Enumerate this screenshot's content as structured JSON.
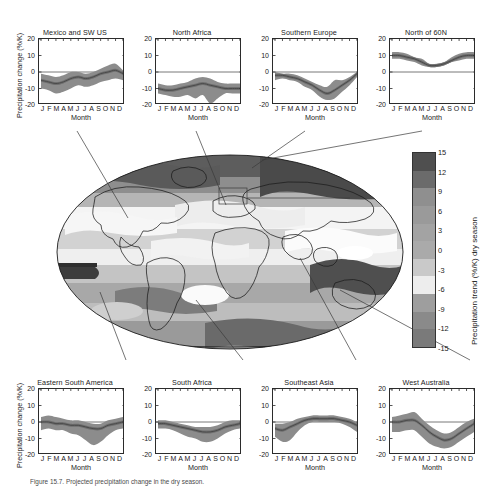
{
  "figure": {
    "caption": "Figure 15.7. Projected precipitation change in the dry season.",
    "ylabel": "Precipitation change (%/K)",
    "xlabel": "Month",
    "months": [
      "J",
      "F",
      "M",
      "A",
      "M",
      "J",
      "J",
      "A",
      "S",
      "O",
      "N",
      "D"
    ],
    "yticks": [
      "20",
      "10",
      "0",
      "-10",
      "-20"
    ],
    "ylim": [
      -20,
      20
    ]
  },
  "colorbar": {
    "label": "Precipitation trend (%/K) dry season",
    "ticks": [
      "15",
      "12",
      "9",
      "6",
      "3",
      "0",
      "-3",
      "-6",
      "-9",
      "-12",
      "-15"
    ],
    "vmin": -15,
    "vmax": 15,
    "colors": [
      "#4f4f4f",
      "#6b6b6b",
      "#8f8f8f",
      "#9a9a9a",
      "#a3a3a3",
      "#aaaaaa",
      "#c9c9c9",
      "#ededed",
      "#9e9e9e",
      "#8a8a8a",
      "#7a7a7a"
    ]
  },
  "chart_data": {
    "type": "area",
    "xlabel": "Month",
    "ylabel": "Precipitation change (%/K)",
    "x": [
      "J",
      "F",
      "M",
      "A",
      "M",
      "J",
      "J",
      "A",
      "S",
      "O",
      "N",
      "D"
    ],
    "ylim": [
      -20,
      20
    ],
    "grid": false,
    "legend": "none",
    "panels": [
      {
        "name": "Mexico and SW US",
        "position": "top-1",
        "mean": [
          -5,
          -6,
          -7,
          -6,
          -4,
          -3,
          -4,
          -3,
          -1,
          0,
          1,
          -1
        ],
        "upper": [
          -1,
          -2,
          -3,
          -2,
          0,
          0,
          -1,
          0,
          2,
          4,
          5,
          1
        ],
        "lower": [
          -10,
          -11,
          -13,
          -12,
          -10,
          -8,
          -9,
          -8,
          -6,
          -5,
          -4,
          -5
        ]
      },
      {
        "name": "North Africa",
        "position": "top-2",
        "mean": [
          -10,
          -11,
          -11,
          -10,
          -9,
          -8,
          -7,
          -8,
          -9,
          -10,
          -10,
          -10
        ],
        "upper": [
          -7,
          -8,
          -8,
          -7,
          -6,
          -4,
          -3,
          -4,
          -6,
          -7,
          -7,
          -7
        ],
        "lower": [
          -13,
          -14,
          -15,
          -15,
          -14,
          -16,
          -14,
          -19,
          -16,
          -13,
          -13,
          -13
        ]
      },
      {
        "name": "Southern Europe",
        "position": "top-3",
        "mean": [
          -2,
          -2,
          -3,
          -4,
          -6,
          -8,
          -11,
          -13,
          -11,
          -8,
          -5,
          -1
        ],
        "upper": [
          0,
          -1,
          -1,
          -2,
          -4,
          -6,
          -8,
          -9,
          -5,
          -5,
          -3,
          0
        ],
        "lower": [
          -5,
          -4,
          -5,
          -6,
          -9,
          -11,
          -15,
          -17,
          -16,
          -12,
          -8,
          -3
        ]
      },
      {
        "name": "North of 60N",
        "position": "top-4",
        "mean": [
          10,
          10,
          9,
          8,
          6,
          4,
          4,
          5,
          7,
          9,
          10,
          10
        ],
        "upper": [
          12,
          12,
          11,
          9,
          8,
          5,
          5,
          6,
          9,
          11,
          12,
          12
        ],
        "lower": [
          8,
          8,
          7,
          6,
          4,
          3,
          3,
          4,
          6,
          7,
          8,
          8
        ]
      },
      {
        "name": "Eastern South America",
        "position": "bottom-1",
        "mean": [
          0,
          0,
          -1,
          -1,
          -2,
          -2,
          -3,
          -4,
          -4,
          -2,
          -1,
          0
        ],
        "upper": [
          3,
          4,
          3,
          2,
          1,
          1,
          0,
          -1,
          -1,
          1,
          2,
          3
        ],
        "lower": [
          -5,
          -4,
          -5,
          -5,
          -7,
          -8,
          -11,
          -14,
          -12,
          -8,
          -5,
          -4
        ]
      },
      {
        "name": "South Africa",
        "position": "bottom-2",
        "mean": [
          -1,
          -1,
          -2,
          -3,
          -4,
          -5,
          -6,
          -6,
          -5,
          -3,
          -2,
          -1
        ],
        "upper": [
          1,
          1,
          0,
          -1,
          -2,
          -3,
          -3,
          -3,
          -2,
          0,
          1,
          1
        ],
        "lower": [
          -4,
          -4,
          -5,
          -7,
          -9,
          -10,
          -12,
          -12,
          -10,
          -7,
          -5,
          -4
        ]
      },
      {
        "name": "Southeast Asia",
        "position": "bottom-3",
        "mean": [
          -4,
          -5,
          -3,
          -1,
          1,
          2,
          2,
          2,
          2,
          1,
          0,
          -2
        ],
        "upper": [
          -1,
          -1,
          0,
          2,
          3,
          4,
          4,
          4,
          4,
          3,
          2,
          0
        ],
        "lower": [
          -9,
          -12,
          -11,
          -6,
          -2,
          0,
          0,
          0,
          0,
          -1,
          -3,
          -6
        ]
      },
      {
        "name": "West Australia",
        "position": "bottom-4",
        "mean": [
          0,
          0,
          1,
          1,
          -2,
          -6,
          -9,
          -11,
          -10,
          -7,
          -4,
          -1
        ],
        "upper": [
          3,
          4,
          5,
          6,
          2,
          -2,
          -5,
          -7,
          -6,
          -3,
          0,
          2
        ],
        "lower": [
          -6,
          -6,
          -5,
          -5,
          -9,
          -13,
          -15,
          -16,
          -15,
          -12,
          -9,
          -6
        ]
      }
    ]
  },
  "map": {
    "projection": "mollweide",
    "regions": [
      "Mexico and SW US",
      "North Africa",
      "Southern Europe",
      "North of 60N",
      "Eastern South America",
      "South Africa",
      "Southeast Asia",
      "West Australia"
    ]
  }
}
